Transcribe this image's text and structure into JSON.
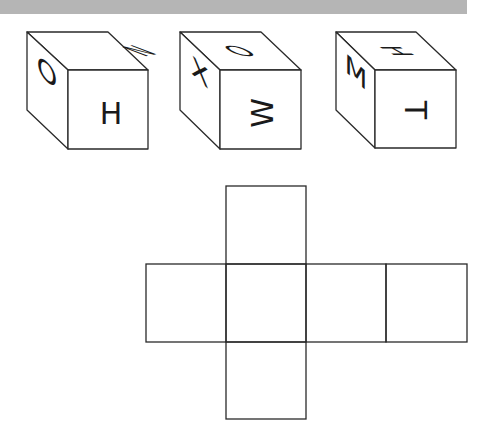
{
  "header_bar": {
    "color": "#b5b5b5"
  },
  "figure": {
    "stroke_color": "#2a2a2a",
    "cubes": [
      {
        "id": "cube-1",
        "top": {
          "letter": "N",
          "rotate": 0
        },
        "left": {
          "letter": "O",
          "rotate": 0
        },
        "front": {
          "letter": "H",
          "rotate": 0
        }
      },
      {
        "id": "cube-2",
        "top": {
          "letter": "O",
          "rotate": 0
        },
        "left": {
          "letter": "X",
          "rotate": 0
        },
        "front": {
          "letter": "W",
          "rotate": -90
        }
      },
      {
        "id": "cube-3",
        "top": {
          "letter": "H",
          "rotate": 90
        },
        "left": {
          "letter": "M",
          "rotate": 0
        },
        "front": {
          "letter": "T",
          "rotate": 90
        }
      }
    ],
    "net": {
      "description": "Unfolded cube net (cross shape), faces blank",
      "cells": [
        {
          "col": 1,
          "row": 0
        },
        {
          "col": 0,
          "row": 1
        },
        {
          "col": 1,
          "row": 1
        },
        {
          "col": 2,
          "row": 1
        },
        {
          "col": 3,
          "row": 1
        },
        {
          "col": 1,
          "row": 2
        }
      ]
    }
  }
}
